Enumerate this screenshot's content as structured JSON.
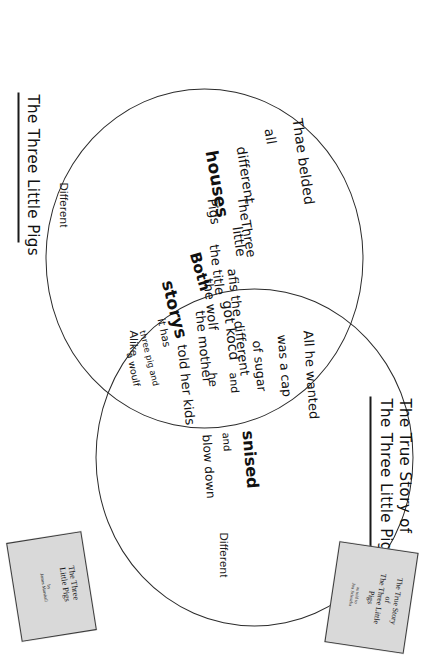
{
  "worksheet": {
    "type": "venn-diagram",
    "region_labels": {
      "different_left": "Different",
      "alike": "Alike",
      "different_right": "Different"
    },
    "headings": {
      "left": "The Three Little Pigs",
      "right_line1": "The True Story of",
      "right_line2": "The Three Little Pigs!"
    },
    "books": {
      "left": {
        "title": "The Three\nLittle Pigs",
        "author": "by\nJames Marshall"
      },
      "right": {
        "title": "The True Story\nof\nThe Three Little\nPigs",
        "author": "as told to\nJon Scieszka"
      }
    },
    "notes": {
      "right_circle": [
        "All he wanted",
        "was a cap",
        "of sugar",
        "and",
        "he",
        "snised",
        "and",
        "blow down",
        "the house"
      ],
      "overlap": [
        "Both",
        "storys",
        "it has",
        "three pig and",
        "a woulf"
      ],
      "left_circle": [
        "Thae belded",
        "all",
        "different",
        "houses",
        "TheThree",
        "little",
        "Pigs",
        "the title",
        "afis the different",
        "the wolf",
        "got kocd",
        "the mother",
        "told her kids",
        "to go tal ther-",
        "forchan"
      ]
    }
  }
}
